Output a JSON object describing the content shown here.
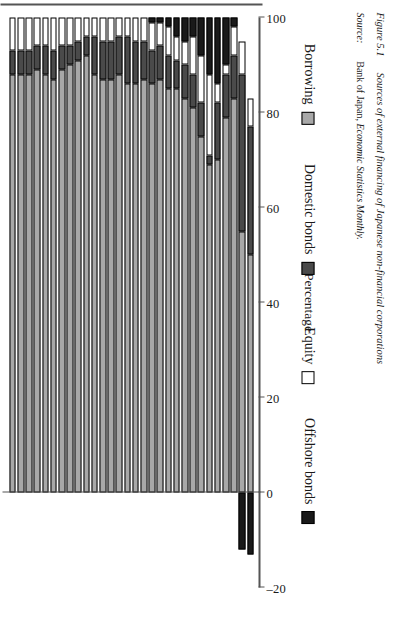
{
  "figure": {
    "source_label": "Source:",
    "source_text_plain": "Bank of Japan, ",
    "source_text_italic": "Economic Statistics Monthly.",
    "caption_label": "Figure 5.1",
    "caption_text": "Sources of external financing of Japanese non-financial corporations"
  },
  "legend": {
    "items": [
      {
        "label": "Offshore bonds",
        "key": "offshore",
        "color": "#1a1a1a"
      },
      {
        "label": "Equity",
        "key": "equity",
        "color": "#ffffff"
      },
      {
        "label": "Domestic bonds",
        "key": "domestic",
        "color": "#4a4a4a"
      },
      {
        "label": "Borrowing",
        "key": "borrowing",
        "color": "#a8a8a8"
      }
    ]
  },
  "chart_data": {
    "type": "bar",
    "orientation": "horizontal-stacked",
    "title": "",
    "xlabel": "Percentage",
    "ylabel": "",
    "xlim": [
      -20,
      100
    ],
    "xticks": [
      -20,
      0,
      20,
      40,
      60,
      80,
      100
    ],
    "xticklabels": [
      "–20",
      "0",
      "20",
      "40",
      "60",
      "80",
      "100"
    ],
    "grid": false,
    "legend_position": "right",
    "stacked": true,
    "categories": [
      "1965",
      "1966",
      "1967",
      "1968",
      "1969",
      "1970",
      "1971",
      "1972",
      "1973",
      "1974",
      "1975",
      "1976",
      "1977",
      "1978",
      "1979",
      "1980",
      "1981",
      "1982",
      "1983",
      "1984",
      "1985",
      "1986",
      "1987",
      "1988",
      "1989",
      "1990",
      "1991",
      "1992",
      "1993",
      "1994"
    ],
    "tick_categories": [
      "1965",
      "1967",
      "1969",
      "1971",
      "1973",
      "1975",
      "1977",
      "1979",
      "1981",
      "1983",
      "1985",
      "1987",
      "1989",
      "1991",
      "1993"
    ],
    "series": [
      {
        "name": "Borrowing",
        "color": "#a8a8a8",
        "values": [
          88,
          88,
          88,
          89,
          88,
          87,
          89,
          90,
          91,
          92,
          88,
          87,
          87,
          88,
          86,
          86,
          87,
          86,
          87,
          85,
          85,
          83,
          81,
          75,
          69,
          70,
          79,
          83,
          55,
          50
        ]
      },
      {
        "name": "Domestic bonds",
        "color": "#4a4a4a",
        "values": [
          5,
          5,
          5,
          5,
          6,
          6,
          5,
          4,
          4,
          4,
          8,
          8,
          8,
          8,
          10,
          9,
          8,
          7,
          7,
          7,
          6,
          7,
          7,
          7,
          2,
          12,
          9,
          9,
          33,
          27
        ]
      },
      {
        "name": "Equity",
        "color": "#ffffff",
        "values": [
          7,
          7,
          7,
          6,
          6,
          7,
          6,
          6,
          5,
          4,
          4,
          5,
          5,
          4,
          4,
          5,
          5,
          6,
          5,
          6,
          5,
          5,
          8,
          10,
          17,
          4,
          2,
          6,
          7,
          6
        ]
      },
      {
        "name": "Offshore bonds",
        "color": "#1a1a1a",
        "values": [
          0,
          0,
          0,
          0,
          0,
          0,
          0,
          0,
          0,
          0,
          0,
          0,
          0,
          0,
          0,
          0,
          0,
          1,
          1,
          2,
          4,
          5,
          4,
          8,
          12,
          14,
          10,
          2,
          -12,
          -13
        ]
      }
    ]
  }
}
